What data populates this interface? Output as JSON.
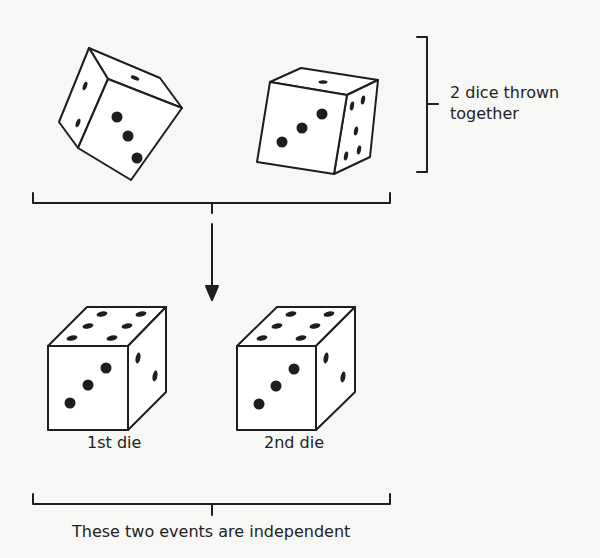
{
  "diagram": {
    "top_group": {
      "label": "2 dice thrown\ntogether",
      "dice": [
        {
          "name": "thrown-die-left",
          "front_face_value": 3,
          "top_face_value": 1,
          "side_face_value": 2
        },
        {
          "name": "thrown-die-right",
          "front_face_value": 3,
          "top_face_value": 1,
          "side_face_value": 6
        }
      ]
    },
    "arrow": {
      "direction": "down"
    },
    "bottom_group": {
      "dice": [
        {
          "label": "1st die",
          "front_face_value": 3,
          "top_face_value": 6,
          "side_face_value": 2
        },
        {
          "label": "2nd die",
          "front_face_value": 3,
          "top_face_value": 6,
          "side_face_value": 2
        }
      ],
      "caption": "These two events are independent"
    },
    "colors": {
      "ink": "#1e1e1e",
      "background": "#f7f7f5",
      "die_face": "#ffffff"
    }
  }
}
